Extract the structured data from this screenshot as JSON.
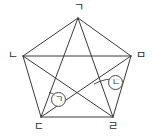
{
  "figure": {
    "type": "geometry-diagram",
    "background_color": "#ffffff",
    "stroke_color": "#3a3a3a",
    "stroke_width": 1,
    "canvas": {
      "width": 153,
      "height": 138
    },
    "vertices": [
      {
        "id": "top",
        "label": "ㄱ",
        "x": 78,
        "y": 18,
        "label_x": 74,
        "label_y": 2
      },
      {
        "id": "left",
        "label": "ㄴ",
        "x": 23,
        "y": 56,
        "label_x": 8,
        "label_y": 50
      },
      {
        "id": "right",
        "label": "ㅁ",
        "x": 131,
        "y": 56,
        "label_x": 136,
        "label_y": 50
      },
      {
        "id": "bottom_left",
        "label": "ㄷ",
        "x": 41,
        "y": 117,
        "label_x": 34,
        "label_y": 121
      },
      {
        "id": "bottom_right",
        "label": "ㄹ",
        "x": 113,
        "y": 117,
        "label_x": 108,
        "label_y": 121
      }
    ],
    "edges": [
      {
        "from": "top",
        "to": "left",
        "kind": "side"
      },
      {
        "from": "top",
        "to": "right",
        "kind": "side"
      },
      {
        "from": "left",
        "to": "bottom_left",
        "kind": "side"
      },
      {
        "from": "right",
        "to": "bottom_right",
        "kind": "side"
      },
      {
        "from": "bottom_left",
        "to": "bottom_right",
        "kind": "side"
      },
      {
        "from": "top",
        "to": "bottom_left",
        "kind": "diagonal"
      },
      {
        "from": "top",
        "to": "bottom_right",
        "kind": "diagonal"
      },
      {
        "from": "left",
        "to": "right",
        "kind": "diagonal"
      },
      {
        "from": "left",
        "to": "bottom_right",
        "kind": "diagonal"
      },
      {
        "from": "right",
        "to": "bottom_left",
        "kind": "diagonal"
      }
    ],
    "angle_marks": [
      {
        "id": "angle-a",
        "label": "ㄱ",
        "circle_x": 51,
        "circle_y": 92,
        "arc": {
          "cx": 41,
          "cy": 117,
          "r": 26,
          "start_deg": -72,
          "end_deg": -36
        }
      },
      {
        "id": "angle-b",
        "label": "ㄴ",
        "circle_x": 108,
        "circle_y": 75,
        "arc": {
          "cx": 113,
          "cy": 117,
          "r": 38,
          "start_deg": -120,
          "end_deg": -80
        }
      }
    ]
  }
}
